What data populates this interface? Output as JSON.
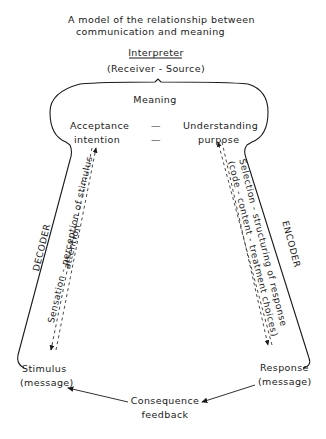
{
  "title": {
    "line1": "A model of the relationship between",
    "line2": "communication and meaning"
  },
  "interpreter": {
    "label": "Interpreter",
    "sublabel": "(Receiver - Source)"
  },
  "meaning": {
    "label": "Meaning",
    "left_top": "Acceptance",
    "left_bottom": "intention",
    "dash1": "—",
    "dash2": "—",
    "right_top": "Understanding",
    "right_bottom": "purpose"
  },
  "decoder": {
    "label": "DECODER",
    "line1": "Sensation - perception of stimulus",
    "line2": "attention"
  },
  "encoder": {
    "label": "ENCODER",
    "line1": "Selection - structuring of response",
    "line2": "(code - content - treatment choices)"
  },
  "stimulus": {
    "line1": "Stimulus",
    "line2": "(message)"
  },
  "response": {
    "line1": "Response",
    "line2": "(message)"
  },
  "feedback": {
    "line1": "Consequence",
    "line2": "feedback"
  },
  "colors": {
    "ink": "#1a1a1a",
    "background": "#ffffff"
  }
}
